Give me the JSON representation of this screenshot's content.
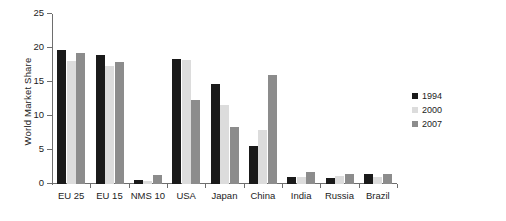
{
  "chart_data": {
    "type": "bar",
    "title": "",
    "xlabel": "",
    "ylabel": "World Market Share",
    "ylim": [
      0,
      25
    ],
    "yticks": [
      0,
      5,
      10,
      15,
      20,
      25
    ],
    "grid": false,
    "legend_position": "right",
    "categories": [
      "EU 25",
      "EU 15",
      "NMS 10",
      "USA",
      "Japan",
      "China",
      "India",
      "Russia",
      "Brazil"
    ],
    "series": [
      {
        "name": "1994",
        "color": "#1a1a1a",
        "values": [
          19.7,
          19.0,
          0.6,
          18.4,
          14.7,
          5.6,
          1.0,
          0.9,
          1.4
        ]
      },
      {
        "name": "2000",
        "color": "#dcdcdc",
        "values": [
          18.1,
          17.4,
          0.5,
          18.2,
          11.6,
          7.9,
          1.0,
          1.2,
          1.1
        ]
      },
      {
        "name": "2007",
        "color": "#8c8c8c",
        "values": [
          19.3,
          17.9,
          1.3,
          12.4,
          8.4,
          16.0,
          1.7,
          1.5,
          1.5
        ]
      }
    ]
  }
}
